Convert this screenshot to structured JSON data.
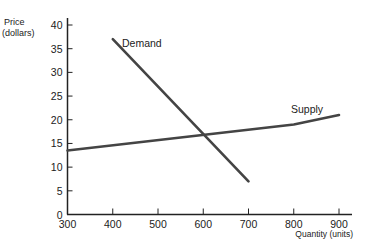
{
  "chart_data": {
    "type": "line",
    "title": "",
    "xlabel": "Quantity (units)",
    "ylabel": "Price (dollars)",
    "ylabel_lines": [
      "Price",
      "(dollars)"
    ],
    "xlim": [
      300,
      900
    ],
    "ylim": [
      0,
      40
    ],
    "x_ticks": [
      300,
      400,
      500,
      600,
      700,
      800,
      900
    ],
    "y_ticks": [
      0,
      5,
      10,
      15,
      20,
      25,
      30,
      35,
      40
    ],
    "grid": false,
    "legend": "none (inline labels)",
    "series": [
      {
        "name": "Demand",
        "label": "Demand",
        "x": [
          400,
          700
        ],
        "y": [
          37,
          7
        ]
      },
      {
        "name": "Supply",
        "label": "Supply",
        "x": [
          300,
          800,
          900
        ],
        "y": [
          13.5,
          19,
          21
        ]
      }
    ],
    "annotations": [
      {
        "text": "Demand",
        "x": 420,
        "y": 36
      },
      {
        "text": "Supply",
        "x": 800,
        "y": 22
      }
    ]
  }
}
